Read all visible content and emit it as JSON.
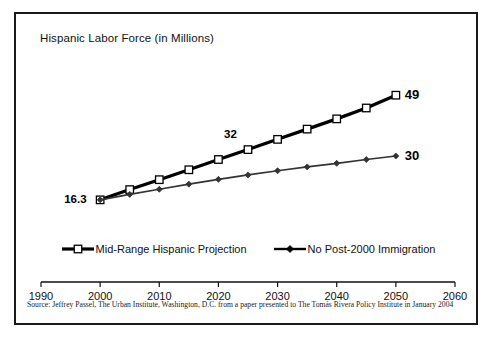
{
  "chart_data": {
    "type": "line",
    "title": "Hispanic Labor Force (in Millions)",
    "xlabel": "",
    "ylabel": "",
    "xlim": [
      1990,
      2060
    ],
    "ylim": [
      0,
      55
    ],
    "grid": false,
    "legend_position": "bottom",
    "xticks": [
      "1990",
      "2000",
      "2010",
      "2020",
      "2030",
      "2040",
      "2050",
      "2060"
    ],
    "x": [
      2000,
      2005,
      2010,
      2015,
      2020,
      2025,
      2030,
      2035,
      2040,
      2045,
      2050
    ],
    "series": [
      {
        "name": "Mid-Range Hispanic Projection",
        "marker": "square-open",
        "color": "#000000",
        "values": [
          16.3,
          19.5,
          22.6,
          25.7,
          28.9,
          32.0,
          35.2,
          38.4,
          41.6,
          45.0,
          49.0
        ]
      },
      {
        "name": "No Post-2000 Immigration",
        "marker": "diamond-filled",
        "color": "#333333",
        "values": [
          16.3,
          18.0,
          19.6,
          21.2,
          22.7,
          24.1,
          25.4,
          26.6,
          27.7,
          28.9,
          30.0
        ]
      }
    ],
    "annotations": [
      {
        "text": "16.3",
        "x": 2000,
        "y": 16.3,
        "anchor": "left"
      },
      {
        "text": "32",
        "x": 2025,
        "y": 32.0,
        "anchor": "above-left"
      },
      {
        "text": "49",
        "x": 2050,
        "y": 49.0,
        "anchor": "right"
      },
      {
        "text": "30",
        "x": 2050,
        "y": 30.0,
        "anchor": "right"
      }
    ]
  },
  "legend": {
    "items": [
      {
        "label": "Mid-Range Hispanic Projection",
        "marker": "square-open"
      },
      {
        "label": "No Post-2000 Immigration",
        "marker": "diamond-filled"
      }
    ]
  },
  "source": {
    "note": "Source:  Jeffrey Passel, The Urban Institute, Washington, D.C. from a paper presented to The Tomás Rivera Policy Institute in January 2004"
  },
  "colors": {
    "frame": "#1a1a1a",
    "axis": "#111111",
    "series_primary": "#000000",
    "series_secondary": "#333333",
    "background": "#ffffff"
  }
}
